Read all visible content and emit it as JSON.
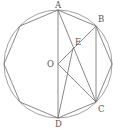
{
  "figure": {
    "type": "geometry",
    "colors": {
      "line": "#6a6a6a",
      "circle": "#8a8a8a",
      "label": "#555555",
      "background": "#ffffff"
    },
    "circle": {
      "cx": 58,
      "cy": 64,
      "r": 54
    },
    "octagon_vertices": [
      [
        58,
        10
      ],
      [
        96,
        26
      ],
      [
        112,
        64
      ],
      [
        96,
        102
      ],
      [
        58,
        118
      ],
      [
        20,
        102
      ],
      [
        4,
        64
      ],
      [
        20,
        26
      ]
    ],
    "points": {
      "A": {
        "x": 58,
        "y": 10,
        "label": "A"
      },
      "B": {
        "x": 96,
        "y": 26,
        "label": "B"
      },
      "C": {
        "x": 96,
        "y": 102,
        "label": "C"
      },
      "D": {
        "x": 58,
        "y": 118,
        "label": "D"
      },
      "O": {
        "x": 58,
        "y": 64,
        "label": "O"
      },
      "E": {
        "x": 73,
        "y": 48,
        "label": "E"
      }
    },
    "segments": [
      [
        "A",
        "D"
      ],
      [
        "B",
        "C"
      ],
      [
        "O",
        "B"
      ],
      [
        "O",
        "C"
      ],
      [
        "A",
        "C"
      ],
      [
        "D",
        "E"
      ]
    ]
  }
}
